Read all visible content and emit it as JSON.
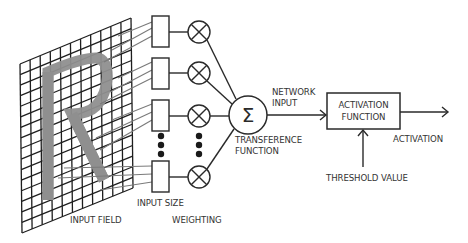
{
  "diagram": {
    "colors": {
      "line": "#2a2a2a",
      "connector": "#7a7a7a",
      "letter": "#8f8f8f",
      "text": "#333333",
      "background": "#ffffff"
    },
    "input_field": {
      "label": "INPUT FIELD",
      "letter": "R",
      "grid_columns": 11,
      "grid_rows": 16
    },
    "input_size": {
      "label": "INPUT SIZE",
      "boxes_visible": 4,
      "ellipsis": "⋮"
    },
    "weighting": {
      "label": "WEIGHTING",
      "multiplier_symbol": "⊗",
      "multipliers_visible": 4
    },
    "transference": {
      "symbol": "Σ",
      "label_line1": "TRANSFERENCE",
      "label_line2": "FUNCTION"
    },
    "network_input": {
      "label_line1": "NETWORK",
      "label_line2": "INPUT"
    },
    "activation_function": {
      "label_line1": "ACTIVATION",
      "label_line2": "FUNCTION"
    },
    "threshold": {
      "label": "THRESHOLD VALUE"
    },
    "output": {
      "label": "ACTIVATION"
    }
  }
}
